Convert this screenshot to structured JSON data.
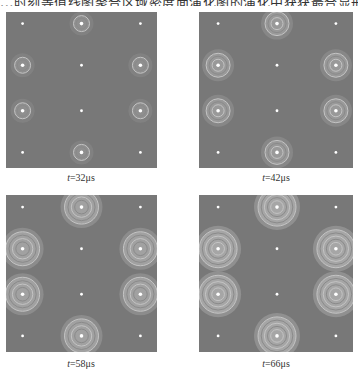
{
  "caption_top": "...时刻等值线图聚合区域密度面演化图的演化中获获最合显形成...",
  "panels": [
    {
      "id": "t32",
      "label_var": "t",
      "label_value": "=32μs",
      "ring_radius": 8,
      "halo": 0.35,
      "detail": 1
    },
    {
      "id": "t42",
      "label_var": "t",
      "label_value": "=42μs",
      "ring_radius": 12,
      "halo": 0.55,
      "detail": 2
    },
    {
      "id": "t58",
      "label_var": "t",
      "label_value": "=58μs",
      "ring_radius": 17,
      "halo": 0.75,
      "detail": 3
    },
    {
      "id": "t66",
      "label_var": "t",
      "label_value": "=66μs",
      "ring_radius": 19,
      "halo": 0.9,
      "detail": 4
    }
  ],
  "colors": {
    "background": "#787878",
    "ring": "#b4b4b4",
    "dot": "#ffffff",
    "page": "#ffffff"
  }
}
